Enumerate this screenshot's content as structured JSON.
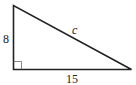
{
  "diagram": {
    "type": "right-triangle",
    "vertical_leg": {
      "label": "8"
    },
    "horizontal_leg": {
      "label": "15"
    },
    "hypotenuse": {
      "label": "c"
    },
    "right_angle_marker": true,
    "stroke_color": "#222222"
  }
}
